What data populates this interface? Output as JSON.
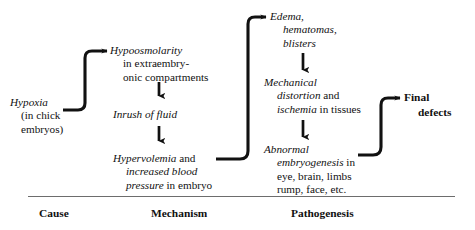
{
  "diagram": {
    "type": "flow-chart",
    "title_visible": false,
    "ink_color": "#111111",
    "rule_color": "#6d6d6d",
    "background": "#ffffff",
    "nodes": {
      "hypoxia": {
        "name": "hypoxia",
        "lines": [
          {
            "text": "Hypoxia",
            "style": "italic"
          },
          {
            "text": "(in chick",
            "style": "roman"
          },
          {
            "text": "embryos)",
            "style": "roman"
          }
        ]
      },
      "hypoosmolarity": {
        "name": "hypoosmolarity",
        "lines": [
          {
            "text": "Hypoosmolarity",
            "style": "italic"
          },
          {
            "text": "in extraembry-",
            "style": "roman"
          },
          {
            "text": "onic compartments",
            "style": "roman"
          }
        ]
      },
      "inrush": {
        "name": "inrush-of-fluid",
        "lines": [
          {
            "text": "Inrush of fluid",
            "style": "italic"
          }
        ]
      },
      "hypervolemia": {
        "name": "hypervolemia",
        "lines": [
          {
            "text_italic": "Hypervolemia",
            "text_roman": " and",
            "style": "mixed"
          },
          {
            "text": "increased blood",
            "style": "italic"
          },
          {
            "text_italic": "pressure",
            "text_roman": " in embryo",
            "style": "mixed"
          }
        ]
      },
      "edema": {
        "name": "edema-hematomas-blisters",
        "lines": [
          {
            "text": "Edema,",
            "style": "italic"
          },
          {
            "text": "hematomas,",
            "style": "italic"
          },
          {
            "text": "blisters",
            "style": "italic"
          }
        ]
      },
      "mechanical": {
        "name": "mechanical-distortion",
        "lines": [
          {
            "text": "Mechanical",
            "style": "italic"
          },
          {
            "text_italic": "distortion",
            "text_roman": " and",
            "style": "mixed"
          },
          {
            "text_italic": "ischemia",
            "text_roman": " in tissues",
            "style": "mixed"
          }
        ]
      },
      "abnormal": {
        "name": "abnormal-embryogenesis",
        "lines": [
          {
            "text": "Abnormal",
            "style": "italic"
          },
          {
            "text_italic": "embryogenesis",
            "text_roman": " in",
            "style": "mixed"
          },
          {
            "text": "eye, brain, limbs",
            "style": "roman"
          },
          {
            "text": "rump, face, etc.",
            "style": "roman"
          }
        ]
      },
      "final_defects": {
        "name": "final-defects",
        "lines": [
          {
            "text": "Final",
            "style": "bold"
          },
          {
            "text": "defects",
            "style": "bold"
          }
        ]
      }
    },
    "columns": [
      {
        "key": "cause",
        "label": "Cause"
      },
      {
        "key": "mechanism",
        "label": "Mechanism"
      },
      {
        "key": "pathogenesis",
        "label": "Pathogenesis"
      }
    ],
    "connectors": [
      {
        "name": "hypoxia-to-hypoosmolarity",
        "kind": "elbow-arrow",
        "from": "hypoxia",
        "to": "hypoosmolarity"
      },
      {
        "name": "hypoosmolarity-to-inrush",
        "kind": "down-arrow",
        "from": "hypoosmolarity",
        "to": "inrush"
      },
      {
        "name": "inrush-to-hypervolemia",
        "kind": "down-arrow",
        "from": "inrush",
        "to": "hypervolemia"
      },
      {
        "name": "hypervolemia-to-edema",
        "kind": "elbow-arrow",
        "from": "hypervolemia",
        "to": "edema"
      },
      {
        "name": "edema-to-mechanical",
        "kind": "down-arrow",
        "from": "edema",
        "to": "mechanical"
      },
      {
        "name": "mechanical-to-abnormal",
        "kind": "down-arrow",
        "from": "mechanical",
        "to": "abnormal"
      },
      {
        "name": "abnormal-to-final-defects",
        "kind": "elbow-arrow",
        "from": "abnormal",
        "to": "final_defects"
      }
    ]
  }
}
